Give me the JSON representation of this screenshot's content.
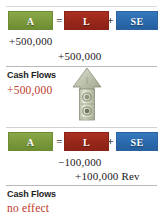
{
  "figure": {
    "colors": {
      "assets": "#79993a",
      "liabilities": "#98271a",
      "stockholders_equity": "#2a6aad",
      "cash_flow_value": "#c0392b",
      "rule": "#b9b9b9"
    },
    "equation": {
      "assets_label": "A",
      "equals_symbol": "=",
      "liabilities_label": "L",
      "plus_symbol": "+",
      "equity_label": "SE"
    },
    "blocks": [
      {
        "id": "block-1",
        "amounts": {
          "assets": "+500,000",
          "liabilities": "+500,000"
        },
        "cash_flows": {
          "label": "Cash Flows",
          "value": "+500,000"
        },
        "icon": "money-up-arrow-icon"
      },
      {
        "id": "block-2",
        "amounts": {
          "liabilities": "−100,000",
          "equity": "+100,000 Rev"
        },
        "cash_flows": {
          "label": "Cash Flows",
          "value": "no effect"
        },
        "icon": null
      }
    ]
  }
}
